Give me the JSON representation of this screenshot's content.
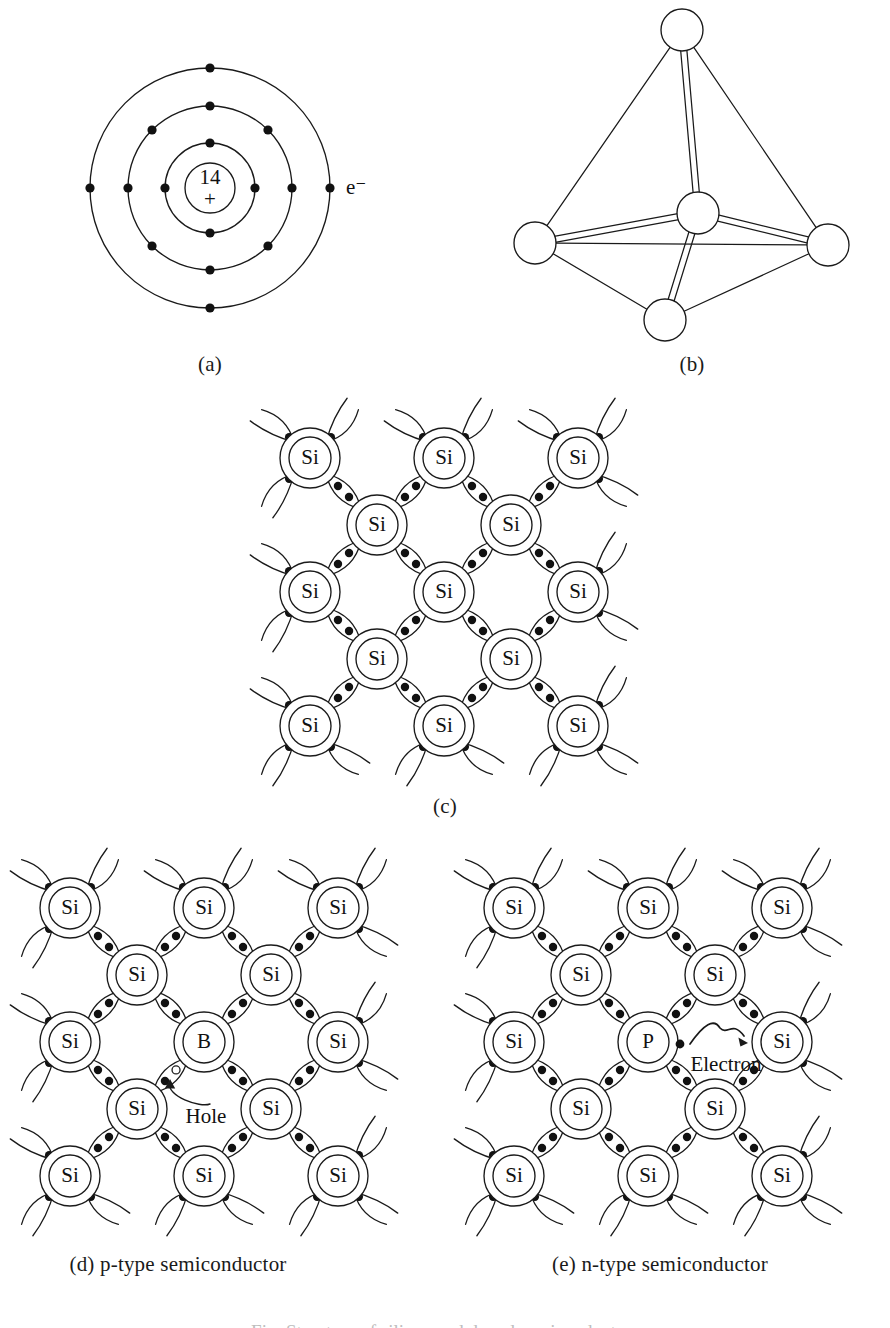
{
  "figure": {
    "background_color": "#ffffff",
    "line_color": "#1a1a1a",
    "electron_color": "#111111",
    "hole_fill": "#ffffff"
  },
  "panels": {
    "a": {
      "caption": "(a)",
      "nucleus_number": "14",
      "nucleus_charge": "+",
      "electron_label": "e⁻",
      "shells": [
        {
          "name": "inner-shell",
          "radius": 45,
          "electron_count": 4,
          "electron_angles": [
            270,
            0,
            90,
            180
          ]
        },
        {
          "name": "middle-shell",
          "radius": 82,
          "electron_count": 8,
          "electron_angles": [
            270,
            315,
            0,
            45,
            90,
            135,
            180,
            225
          ]
        },
        {
          "name": "outer-shell",
          "radius": 120,
          "electron_count": 4,
          "electron_angles": [
            270,
            0,
            90,
            180
          ]
        }
      ],
      "nucleus_radius": 25,
      "center": {
        "x": 210,
        "y": 188
      }
    },
    "b": {
      "caption": "(b)",
      "node_radius": 21,
      "nodes": [
        {
          "name": "apex-atom",
          "x": 682,
          "y": 30
        },
        {
          "name": "center-atom",
          "x": 698,
          "y": 213
        },
        {
          "name": "left-atom",
          "x": 535,
          "y": 243
        },
        {
          "name": "right-atom",
          "x": 828,
          "y": 245
        },
        {
          "name": "bottom-atom",
          "x": 665,
          "y": 320
        }
      ],
      "outer_edges": [
        [
          "apex-atom",
          "left-atom"
        ],
        [
          "apex-atom",
          "right-atom"
        ],
        [
          "left-atom",
          "right-atom"
        ],
        [
          "left-atom",
          "bottom-atom"
        ],
        [
          "right-atom",
          "bottom-atom"
        ]
      ],
      "double_bonds": [
        [
          "center-atom",
          "apex-atom"
        ],
        [
          "center-atom",
          "left-atom"
        ],
        [
          "center-atom",
          "right-atom"
        ],
        [
          "center-atom",
          "bottom-atom"
        ]
      ]
    },
    "c": {
      "caption": "(c)",
      "atom_label": "Si",
      "origin": {
        "x": 255,
        "y": 405
      },
      "cell": 134,
      "main_atoms": [
        [
          "Si",
          "Si",
          "Si"
        ],
        [
          "Si",
          "Si",
          "Si"
        ],
        [
          "Si",
          "Si",
          "Si"
        ]
      ],
      "interstitial_atoms": [
        [
          "Si",
          "Si"
        ],
        [
          "Si",
          "Si"
        ]
      ]
    },
    "d": {
      "caption": "(d)  p-type semiconductor",
      "atom_label": "Si",
      "dopant_label": "B",
      "dopant_position": {
        "row": 1,
        "col": 1
      },
      "annotation": "Hole",
      "annotation_kind": "hole",
      "origin": {
        "x": 12,
        "y": 845
      },
      "cell": 134
    },
    "e": {
      "caption": "(e) n-type semiconductor",
      "atom_label": "Si",
      "dopant_label": "P",
      "dopant_position": {
        "row": 1,
        "col": 1
      },
      "annotation": "Electron",
      "annotation_kind": "electron",
      "origin": {
        "x": 452,
        "y": 845
      },
      "cell": 134
    }
  },
  "captions": {
    "a_x": 210,
    "a_y": 355,
    "b_x": 692,
    "b_y": 355,
    "c_x": 445,
    "c_y": 797,
    "d_x": 178,
    "d_y": 1258,
    "e_x": 660,
    "e_y": 1258
  },
  "cut_off_footer_text": "Fig. Structure of silicon and doped semiconductors"
}
